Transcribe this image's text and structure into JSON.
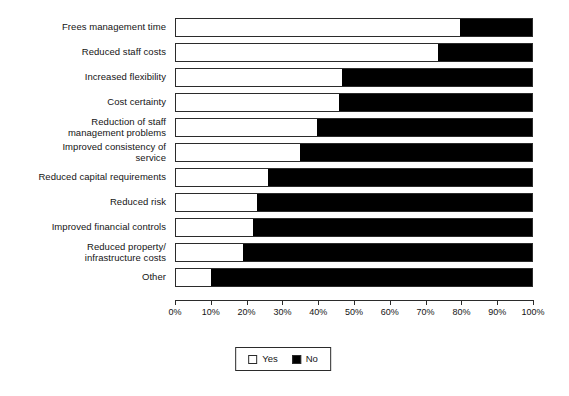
{
  "chart_data": {
    "type": "bar",
    "orientation": "horizontal",
    "stacked": true,
    "stack_total": 100,
    "title": "",
    "subtitle": "",
    "xlabel": "",
    "ylabel": "",
    "xlim": [
      0,
      100
    ],
    "grid": false,
    "legend_position": "bottom-center",
    "value_unit": "%",
    "categories": [
      "Frees management time",
      "Reduced staff costs",
      "Increased flexibility",
      "Cost certainty",
      "Reduction of staff\nmanagement problems",
      "Improved consistency of\nservice",
      "Reduced capital requirements",
      "Reduced risk",
      "Improved financial controls",
      "Reduced property/\ninfrastructure costs",
      "Other"
    ],
    "series": [
      {
        "name": "Yes",
        "color": "#ffffff",
        "values": [
          80,
          74,
          47,
          46,
          40,
          35,
          26,
          23,
          22,
          19,
          10
        ]
      },
      {
        "name": "No",
        "color": "#000000",
        "values": [
          20,
          26,
          53,
          54,
          60,
          65,
          74,
          77,
          78,
          81,
          90
        ]
      }
    ],
    "xticks": [
      0,
      10,
      20,
      30,
      40,
      50,
      60,
      70,
      80,
      90,
      100
    ],
    "xticklabels": [
      "0%",
      "10%",
      "20%",
      "30%",
      "40%",
      "50%",
      "60%",
      "70%",
      "80%",
      "90%",
      "100%"
    ],
    "legend": [
      {
        "label": "Yes",
        "swatch": "swatch-yes"
      },
      {
        "label": "No",
        "swatch": "swatch-no"
      }
    ]
  }
}
